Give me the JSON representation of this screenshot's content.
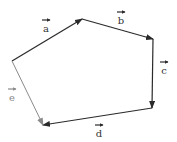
{
  "diagram": {
    "type": "vector-polygon",
    "colors": {
      "primary_stroke": "#2a2a2a",
      "secondary_stroke": "#8a8a8a",
      "background": "#ffffff"
    },
    "vertices": {
      "A": [
        12,
        61
      ],
      "B": [
        82,
        19
      ],
      "C": [
        153,
        39
      ],
      "D": [
        152,
        108
      ],
      "E": [
        43,
        125
      ]
    },
    "vectors": [
      {
        "id": "a",
        "label": "a",
        "from": "A",
        "to": "B",
        "color": "#2a2a2a",
        "label_pos": [
          46,
          32
        ],
        "overarrow_pos": [
          46,
          20
        ]
      },
      {
        "id": "b",
        "label": "b",
        "from": "B",
        "to": "C",
        "color": "#2a2a2a",
        "label_pos": [
          121,
          24
        ],
        "overarrow_pos": [
          121,
          12
        ]
      },
      {
        "id": "c",
        "label": "c",
        "from": "C",
        "to": "D",
        "color": "#2a2a2a",
        "label_pos": [
          164,
          74
        ],
        "overarrow_pos": [
          164,
          62
        ]
      },
      {
        "id": "d",
        "label": "d",
        "from": "D",
        "to": "E",
        "color": "#2a2a2a",
        "label_pos": [
          99,
          137
        ],
        "overarrow_pos": [
          99,
          125
        ]
      },
      {
        "id": "e",
        "label": "e",
        "from": "A",
        "to": "E",
        "color": "#8a8a8a",
        "label_pos": [
          12,
          101
        ],
        "overarrow_pos": [
          12,
          89
        ]
      }
    ]
  }
}
